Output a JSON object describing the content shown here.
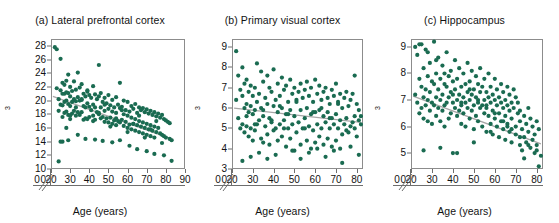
{
  "figure": {
    "axis_label_x": "Age (years)",
    "axis_label_y": "Adjusted volume (cm",
    "axis_label_y_sup": "3",
    "axis_label_y_close": ")",
    "point_color": "#1a6b51",
    "trend_color": "#a6a6a6",
    "frame_color": "#8c8c8c"
  },
  "chart_data": [
    {
      "type": "scatter",
      "panel": "a",
      "title": "(a) Lateral prefrontal cortex",
      "xlabel": "Age (years)",
      "ylabel": "Adjusted volume (cm3)",
      "xlim": [
        20,
        90
      ],
      "ylim": [
        10,
        29
      ],
      "xticks": [
        20,
        30,
        40,
        50,
        60,
        70,
        80,
        90
      ],
      "yticks": [
        10,
        12,
        14,
        16,
        18,
        20,
        22,
        24,
        26,
        28
      ],
      "axis_break_x": true,
      "axis_break_y": true,
      "zero_label": "0",
      "grid": false,
      "legend": "none",
      "trend": {
        "x": [
          21,
          84
        ],
        "y": [
          20.6,
          14.3
        ]
      },
      "x": [
        22,
        23,
        23,
        24,
        24,
        25,
        25,
        25,
        26,
        26,
        26,
        26,
        27,
        27,
        27,
        27,
        28,
        28,
        28,
        28,
        29,
        29,
        29,
        29,
        30,
        30,
        30,
        30,
        31,
        31,
        31,
        32,
        32,
        32,
        33,
        33,
        33,
        34,
        34,
        34,
        35,
        35,
        35,
        36,
        36,
        36,
        37,
        37,
        37,
        38,
        38,
        38,
        39,
        39,
        39,
        40,
        40,
        40,
        41,
        41,
        42,
        42,
        42,
        43,
        43,
        43,
        44,
        44,
        45,
        45,
        45,
        46,
        46,
        46,
        47,
        47,
        48,
        48,
        48,
        49,
        49,
        50,
        50,
        50,
        51,
        51,
        52,
        52,
        52,
        53,
        53,
        54,
        54,
        54,
        55,
        55,
        56,
        56,
        56,
        57,
        57,
        58,
        58,
        58,
        59,
        59,
        60,
        60,
        60,
        61,
        61,
        62,
        62,
        62,
        63,
        63,
        64,
        64,
        64,
        65,
        65,
        66,
        66,
        66,
        67,
        67,
        68,
        68,
        68,
        69,
        69,
        70,
        70,
        70,
        71,
        71,
        72,
        72,
        72,
        73,
        73,
        74,
        74,
        74,
        75,
        75,
        76,
        76,
        77,
        77,
        78,
        78,
        79,
        79,
        80,
        80,
        81,
        82,
        82,
        83,
        24,
        26,
        28,
        30,
        33,
        36,
        39,
        42,
        45,
        48,
        51,
        54,
        57,
        60,
        63,
        66,
        69,
        72,
        75,
        78,
        25,
        29,
        34,
        38,
        43,
        47,
        52,
        56,
        61,
        65,
        70,
        74,
        79,
        83
      ],
      "y": [
        27.8,
        27.5,
        21.8,
        20.2,
        18.5,
        26.1,
        21.5,
        19.4,
        22.6,
        21.0,
        19.3,
        17.6,
        22.3,
        21.0,
        19.8,
        18.2,
        22.9,
        21.2,
        20.0,
        18.4,
        23.8,
        21.1,
        19.5,
        17.9,
        22.0,
        20.6,
        19.2,
        17.3,
        21.4,
        19.8,
        18.1,
        22.8,
        20.2,
        18.5,
        21.6,
        19.9,
        17.8,
        24.1,
        20.5,
        18.3,
        21.9,
        20.0,
        17.9,
        22.4,
        20.1,
        18.3,
        21.0,
        19.2,
        17.2,
        20.6,
        19.0,
        17.4,
        21.3,
        19.6,
        17.3,
        20.8,
        19.1,
        17.6,
        20.4,
        18.6,
        22.1,
        19.4,
        17.8,
        20.9,
        19.0,
        17.2,
        20.2,
        18.3,
        25.2,
        20.6,
        18.0,
        21.1,
        19.0,
        17.4,
        19.8,
        17.6,
        20.4,
        18.5,
        16.9,
        19.6,
        17.4,
        20.8,
        18.8,
        16.8,
        19.3,
        17.5,
        20.1,
        18.4,
        16.6,
        19.0,
        17.1,
        20.5,
        18.2,
        16.4,
        19.4,
        17.0,
        22.6,
        18.9,
        16.8,
        19.1,
        17.2,
        20.0,
        18.0,
        16.3,
        18.6,
        16.9,
        19.8,
        17.8,
        16.0,
        18.4,
        16.5,
        19.2,
        17.5,
        15.8,
        18.8,
        16.6,
        19.5,
        17.3,
        15.6,
        18.2,
        16.4,
        19.0,
        17.0,
        15.4,
        18.6,
        16.2,
        18.9,
        16.8,
        15.2,
        18.3,
        16.0,
        18.7,
        16.6,
        15.0,
        18.1,
        15.8,
        18.5,
        16.4,
        14.8,
        17.9,
        15.6,
        18.3,
        16.2,
        14.6,
        17.7,
        15.4,
        18.1,
        16.0,
        17.5,
        15.2,
        17.9,
        15.0,
        17.3,
        14.8,
        17.1,
        14.6,
        16.9,
        14.4,
        16.7,
        14.2,
        11.1,
        14.0,
        16.0,
        17.8,
        19.0,
        20.2,
        21.5,
        17.0,
        18.2,
        19.4,
        16.2,
        17.4,
        18.6,
        15.4,
        16.6,
        17.8,
        14.6,
        15.8,
        17.0,
        13.8,
        14.0,
        14.2,
        15.0,
        14.4,
        14.3,
        14.1,
        13.9,
        14.2,
        13.4,
        12.9,
        12.6,
        12.2,
        12.0,
        11.2
      ]
    },
    {
      "type": "scatter",
      "panel": "b",
      "title": "(b) Primary visual cortex",
      "xlabel": "Age (years)",
      "ylabel": "Adjusted volume (cm3)",
      "xlim": [
        20,
        83
      ],
      "ylim": [
        3,
        9.4
      ],
      "xticks": [
        20,
        30,
        40,
        50,
        60,
        70,
        80
      ],
      "yticks": [
        3,
        4,
        5,
        6,
        7,
        8,
        9
      ],
      "axis_break_x": true,
      "axis_break_y": true,
      "zero_label": "0",
      "grid": false,
      "legend": "none",
      "trend": {
        "x": [
          21,
          82
        ],
        "y": [
          6.0,
          5.3
        ]
      },
      "x": [
        22,
        22,
        23,
        23,
        24,
        24,
        25,
        25,
        25,
        26,
        26,
        26,
        27,
        27,
        27,
        28,
        28,
        28,
        29,
        29,
        29,
        30,
        30,
        30,
        31,
        31,
        31,
        32,
        32,
        32,
        33,
        33,
        34,
        34,
        34,
        35,
        35,
        35,
        36,
        36,
        37,
        37,
        37,
        38,
        38,
        38,
        39,
        39,
        40,
        40,
        40,
        41,
        41,
        42,
        42,
        42,
        43,
        43,
        44,
        44,
        44,
        45,
        45,
        46,
        46,
        46,
        47,
        47,
        48,
        48,
        48,
        49,
        49,
        50,
        50,
        50,
        51,
        51,
        52,
        52,
        53,
        53,
        53,
        54,
        54,
        55,
        55,
        56,
        56,
        56,
        57,
        57,
        58,
        58,
        58,
        59,
        59,
        60,
        60,
        60,
        61,
        61,
        62,
        62,
        62,
        63,
        63,
        64,
        64,
        64,
        65,
        65,
        66,
        66,
        66,
        67,
        67,
        68,
        68,
        68,
        69,
        69,
        70,
        70,
        70,
        71,
        71,
        72,
        72,
        72,
        73,
        73,
        74,
        74,
        75,
        75,
        76,
        76,
        77,
        77,
        78,
        78,
        79,
        79,
        80,
        80,
        81,
        81,
        82,
        82,
        25,
        29,
        33,
        37,
        41,
        45,
        49,
        53,
        57,
        61,
        65,
        69,
        73,
        77,
        81,
        27,
        31,
        35,
        39,
        43,
        47,
        51,
        55,
        59,
        63,
        67,
        71,
        75,
        79
      ],
      "y": [
        8.8,
        6.4,
        7.6,
        5.5,
        6.9,
        5.0,
        8.0,
        6.6,
        5.2,
        7.2,
        6.0,
        4.8,
        7.4,
        6.2,
        5.1,
        6.8,
        5.8,
        4.6,
        7.1,
        6.1,
        5.0,
        6.6,
        5.7,
        4.4,
        7.0,
        5.9,
        4.9,
        8.2,
        6.3,
        5.2,
        6.7,
        5.4,
        7.8,
        6.0,
        4.5,
        7.3,
        5.6,
        4.3,
        6.5,
        5.1,
        7.6,
        6.2,
        4.7,
        7.0,
        5.5,
        4.2,
        6.8,
        5.3,
        7.9,
        6.1,
        4.9,
        6.4,
        5.0,
        7.2,
        5.8,
        4.4,
        6.6,
        5.2,
        7.5,
        6.0,
        4.6,
        6.9,
        5.4,
        7.1,
        5.7,
        4.1,
        6.3,
        5.0,
        7.4,
        5.9,
        4.5,
        6.7,
        5.2,
        7.0,
        5.6,
        3.9,
        6.4,
        4.8,
        6.8,
        5.3,
        7.2,
        5.9,
        4.2,
        6.5,
        5.0,
        6.9,
        5.5,
        7.3,
        6.0,
        4.4,
        6.6,
        5.1,
        7.0,
        5.7,
        4.0,
        6.3,
        4.9,
        7.4,
        5.8,
        4.3,
        6.7,
        5.2,
        7.1,
        5.9,
        4.6,
        6.4,
        5.0,
        6.8,
        5.6,
        4.2,
        7.0,
        5.3,
        6.5,
        5.8,
        4.5,
        6.2,
        5.0,
        6.9,
        5.5,
        4.1,
        6.6,
        5.2,
        7.2,
        5.7,
        4.4,
        6.3,
        5.0,
        6.7,
        5.4,
        4.0,
        6.0,
        4.7,
        6.5,
        5.2,
        6.8,
        5.5,
        6.1,
        4.8,
        6.4,
        5.1,
        6.7,
        5.3,
        7.6,
        5.0,
        6.2,
        4.6,
        5.9,
        5.4,
        5.6,
        5.2,
        3.4,
        3.6,
        3.8,
        3.5,
        3.7,
        5.0,
        3.9,
        3.5,
        3.8,
        4.0,
        3.6,
        3.9,
        3.3,
        4.1,
        3.7,
        5.6,
        5.2,
        5.9,
        5.4,
        6.1,
        5.7,
        6.3,
        5.0,
        5.8,
        6.0,
        5.5,
        6.2,
        4.9,
        5.6
      ]
    },
    {
      "type": "scatter",
      "panel": "c",
      "title": "(c) Hippocampus",
      "xlabel": "Age (years)",
      "ylabel": "Adjusted volume (cm3)",
      "xlim": [
        20,
        83
      ],
      "ylim": [
        4.4,
        9.3
      ],
      "xticks": [
        20,
        30,
        40,
        50,
        60,
        70,
        80
      ],
      "yticks": [
        5,
        6,
        7,
        8,
        9
      ],
      "axis_break_x": true,
      "axis_break_y": true,
      "zero_label": "0",
      "grid": false,
      "legend": "none",
      "trend": {
        "x": [
          21,
          82
        ],
        "y": [
          7.15,
          5.35
        ]
      },
      "x": [
        22,
        22,
        23,
        23,
        24,
        24,
        25,
        25,
        25,
        26,
        26,
        26,
        27,
        27,
        27,
        28,
        28,
        28,
        29,
        29,
        29,
        30,
        30,
        30,
        31,
        31,
        31,
        32,
        32,
        32,
        33,
        33,
        33,
        34,
        34,
        34,
        35,
        35,
        35,
        36,
        36,
        36,
        37,
        37,
        37,
        38,
        38,
        38,
        39,
        39,
        39,
        40,
        40,
        40,
        41,
        41,
        41,
        42,
        42,
        42,
        43,
        43,
        43,
        44,
        44,
        44,
        45,
        45,
        45,
        46,
        46,
        46,
        47,
        47,
        47,
        48,
        48,
        48,
        49,
        49,
        49,
        50,
        50,
        50,
        51,
        51,
        51,
        52,
        52,
        52,
        53,
        53,
        53,
        54,
        54,
        54,
        55,
        55,
        55,
        56,
        56,
        56,
        57,
        57,
        57,
        58,
        58,
        58,
        59,
        59,
        59,
        60,
        60,
        60,
        61,
        61,
        61,
        62,
        62,
        62,
        63,
        63,
        63,
        64,
        64,
        64,
        65,
        65,
        65,
        66,
        66,
        66,
        67,
        67,
        67,
        68,
        68,
        68,
        69,
        69,
        70,
        70,
        70,
        71,
        71,
        72,
        72,
        72,
        73,
        73,
        74,
        74,
        75,
        75,
        76,
        76,
        77,
        77,
        78,
        78,
        79,
        79,
        80,
        80,
        81,
        81,
        82,
        24,
        28,
        32,
        36,
        40,
        44,
        48,
        52,
        56,
        60,
        64,
        68,
        72,
        76,
        80,
        26,
        34,
        42,
        50,
        58,
        66,
        74
      ],
      "y": [
        9.0,
        7.2,
        8.7,
        6.9,
        7.8,
        6.5,
        9.1,
        7.5,
        6.7,
        8.2,
        7.1,
        6.3,
        8.9,
        7.4,
        6.8,
        7.9,
        7.0,
        6.2,
        8.4,
        7.3,
        6.6,
        7.7,
        6.9,
        6.1,
        9.2,
        7.6,
        6.8,
        8.0,
        7.1,
        6.4,
        8.6,
        7.4,
        6.7,
        7.8,
        7.0,
        6.2,
        8.3,
        7.2,
        6.6,
        7.6,
        6.8,
        6.0,
        8.8,
        7.5,
        6.9,
        7.9,
        7.1,
        6.3,
        8.1,
        7.3,
        6.5,
        7.7,
        6.9,
        5.0,
        8.5,
        7.4,
        6.7,
        7.8,
        7.0,
        6.4,
        8.2,
        7.2,
        6.6,
        7.5,
        6.8,
        6.1,
        8.0,
        7.1,
        6.5,
        7.6,
        6.9,
        6.0,
        8.4,
        7.3,
        6.7,
        7.7,
        7.0,
        6.3,
        8.1,
        7.2,
        6.6,
        7.4,
        6.8,
        5.9,
        7.9,
        7.1,
        6.4,
        7.6,
        6.9,
        6.2,
        8.2,
        7.3,
        6.7,
        7.5,
        6.8,
        6.0,
        7.8,
        7.0,
        6.5,
        7.3,
        6.7,
        5.8,
        8.0,
        7.1,
        6.4,
        7.5,
        6.9,
        6.1,
        7.2,
        6.6,
        5.7,
        7.8,
        7.0,
        6.3,
        7.4,
        6.8,
        6.0,
        7.1,
        6.5,
        5.6,
        7.6,
        6.9,
        6.2,
        7.3,
        6.7,
        5.9,
        7.0,
        6.4,
        5.5,
        7.5,
        6.8,
        6.1,
        7.2,
        6.6,
        5.8,
        6.9,
        6.3,
        5.4,
        7.4,
        6.7,
        6.0,
        7.1,
        5.7,
        6.5,
        6.9,
        5.3,
        6.2,
        6.6,
        5.9,
        5.1,
        6.4,
        5.6,
        6.1,
        5.4,
        6.7,
        5.8,
        6.3,
        5.2,
        6.0,
        5.5,
        5.7,
        5.0,
        6.2,
        5.3,
        5.9,
        4.5,
        4.9,
        9.1,
        8.8,
        8.5,
        8.0,
        7.2,
        6.9,
        7.4,
        7.0,
        6.8,
        6.5,
        6.2,
        5.9,
        5.6,
        5.3,
        5.1,
        5.1,
        5.2,
        5.0,
        5.4,
        5.8,
        6.0,
        4.8
      ]
    }
  ]
}
